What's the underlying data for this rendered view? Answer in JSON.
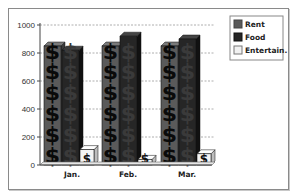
{
  "chart_data": {
    "type": "bar",
    "style": "3d-pictogram",
    "title": "",
    "xlabel": "",
    "ylabel": "",
    "categories": [
      "Jan.",
      "Feb.",
      "Mar."
    ],
    "series": [
      {
        "name": "Rent",
        "values": [
          850,
          850,
          850
        ],
        "color": "#5a5a5a"
      },
      {
        "name": "Food",
        "values": [
          820,
          920,
          900
        ],
        "color": "#262626"
      },
      {
        "name": "Entertain.",
        "values": [
          110,
          40,
          80
        ],
        "color": "#f2f2f2"
      }
    ],
    "ylim": [
      0,
      1000
    ],
    "yticks": [
      0,
      200,
      400,
      600,
      800,
      1000
    ],
    "ytick_labels": [
      "0",
      "200",
      "400",
      "600",
      "800",
      "1000"
    ],
    "grid": true,
    "legend_position": "top-right",
    "pictogram_symbol": "$"
  },
  "legend": {
    "items": [
      {
        "label": "Rent",
        "color": "#5a5a5a"
      },
      {
        "label": "Food",
        "color": "#262626"
      },
      {
        "label": "Entertain.",
        "color": "#f2f2f2"
      }
    ]
  }
}
